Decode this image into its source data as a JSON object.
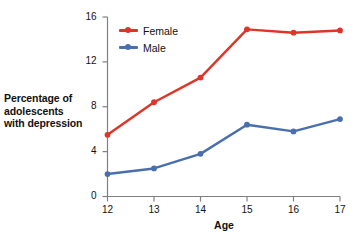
{
  "chart_data": {
    "type": "line",
    "title": "",
    "xlabel": "Age",
    "ylabel": "Percentage of adolescents with depression",
    "x": [
      12,
      13,
      14,
      15,
      16,
      17
    ],
    "xticklabels": [
      "12",
      "13",
      "14",
      "15",
      "16",
      "17"
    ],
    "yticklabels": [
      "0",
      "4",
      "8",
      "12",
      "16"
    ],
    "yticks": [
      0,
      4,
      8,
      12,
      16
    ],
    "xlim": [
      12,
      17
    ],
    "ylim": [
      0,
      16
    ],
    "grid": false,
    "legend_position": "upper-left-inside",
    "series": [
      {
        "name": "Female",
        "color": "#e03428",
        "values": [
          5.5,
          8.4,
          10.6,
          14.9,
          14.6,
          14.8
        ]
      },
      {
        "name": "Male",
        "color": "#4a6fb0",
        "values": [
          2.0,
          2.5,
          3.8,
          6.4,
          5.8,
          6.9
        ]
      }
    ]
  },
  "axis": {
    "y_title_line1": "Percentage of",
    "y_title_line2": "adolescents",
    "y_title_line3": "with depression",
    "x_title": "Age",
    "axis_color": "#808080"
  },
  "legend": {
    "items": [
      {
        "label": "Female",
        "color": "#e03428"
      },
      {
        "label": "Male",
        "color": "#4a6fb0"
      }
    ]
  }
}
